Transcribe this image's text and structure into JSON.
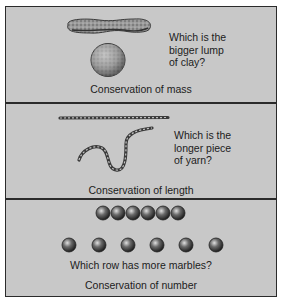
{
  "panels": [
    {
      "id": "mass",
      "question_lines": [
        "Which is the",
        "bigger lump",
        "of clay?"
      ],
      "caption": "Conservation of mass",
      "illustrations": [
        "clay-sausage",
        "clay-ball"
      ]
    },
    {
      "id": "length",
      "question_lines": [
        "Which is the",
        "longer piece",
        "of yarn?"
      ],
      "caption": "Conservation of length",
      "illustrations": [
        "straight-yarn",
        "wavy-yarn"
      ]
    },
    {
      "id": "number",
      "question": "Which row has more marbles?",
      "caption": "Conservation of number",
      "illustrations": {
        "top_row_marbles": 6,
        "bottom_row_marbles": 6
      }
    }
  ],
  "colors": {
    "background": "#c8c8c8",
    "border": "#2b2b2b",
    "text": "#1c1c1c"
  }
}
